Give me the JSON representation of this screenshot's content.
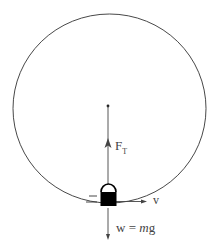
{
  "diagram": {
    "labels": {
      "tension_main": "F",
      "tension_sub": "T",
      "velocity": "v",
      "weight_w": "w",
      "weight_eq": "=",
      "weight_m": "m",
      "weight_g": "g"
    },
    "colors": {
      "stroke": "#333333",
      "text": "#444444",
      "mass_fill": "#000000"
    }
  }
}
